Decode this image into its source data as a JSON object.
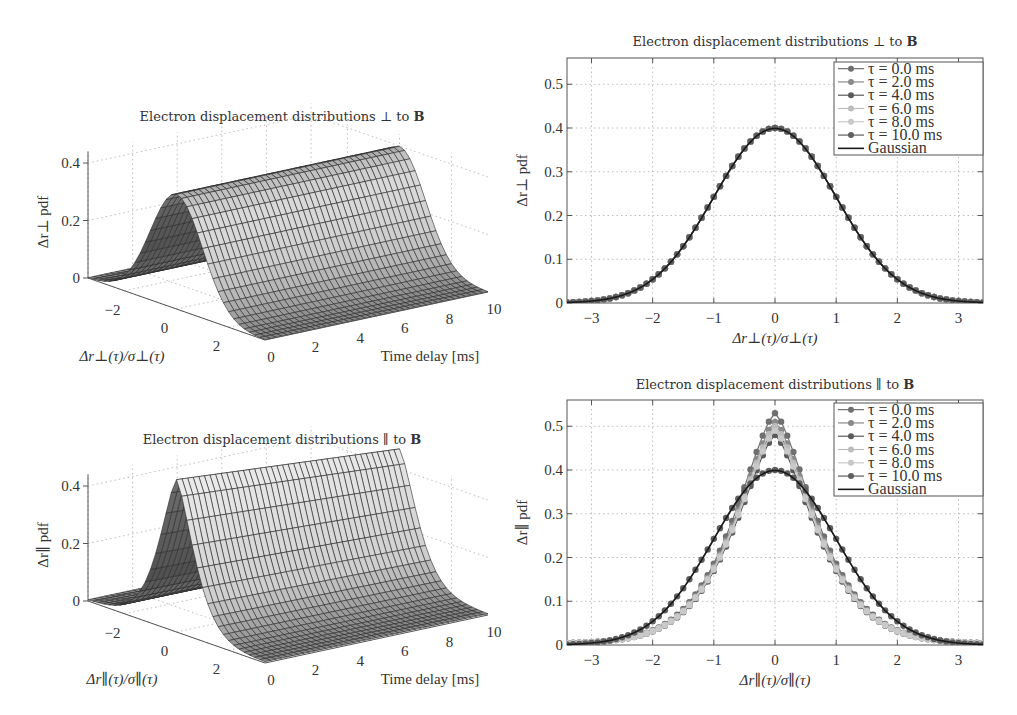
{
  "chart_data": [
    {
      "id": "surf_perp",
      "type": "surface3d",
      "title": "Electron displacement distributions ⊥ to B",
      "xlabel": "Δr⊥(τ)/σ⊥(τ)",
      "ylabel": "Time delay [ms]",
      "zlabel": "Δr⊥ pdf",
      "x_range": [
        -3.4,
        3.4
      ],
      "y_range": [
        0,
        10
      ],
      "z_range": [
        0,
        0.4
      ],
      "x_ticks": [
        -2,
        0,
        2
      ],
      "y_ticks": [
        0,
        2,
        4,
        6,
        8,
        10
      ],
      "z_ticks": [
        0,
        0.2,
        0.4
      ],
      "surface": "Gaussian in x, constant over time; peak 0.40 at x=0",
      "peak_by_time": {
        "0": 0.4,
        "10": 0.4
      }
    },
    {
      "id": "line_perp",
      "type": "line",
      "title": "Electron displacement distributions ⊥ to B",
      "xlabel": "Δr⊥(τ)/σ⊥(τ)",
      "ylabel": "Δr⊥ pdf",
      "xlim": [
        -3.4,
        3.4
      ],
      "ylim": [
        0,
        0.56
      ],
      "x_ticks": [
        -3,
        -2,
        -1,
        0,
        1,
        2,
        3
      ],
      "y_ticks": [
        0,
        0.1,
        0.2,
        0.3,
        0.4,
        0.5
      ],
      "grid": true,
      "legend_position": "upper right",
      "series": [
        {
          "name": "τ = 0.0 ms",
          "color": "#6f6f6f",
          "peak": 0.4,
          "shape": "gaussian"
        },
        {
          "name": "τ = 2.0 ms",
          "color": "#8a8a8a",
          "peak": 0.4,
          "shape": "gaussian"
        },
        {
          "name": "τ = 4.0 ms",
          "color": "#5a5a5a",
          "peak": 0.4,
          "shape": "gaussian"
        },
        {
          "name": "τ = 6.0 ms",
          "color": "#bcbcbc",
          "peak": 0.4,
          "shape": "gaussian"
        },
        {
          "name": "τ = 8.0 ms",
          "color": "#c9c9c9",
          "peak": 0.4,
          "shape": "gaussian"
        },
        {
          "name": "τ = 10.0 ms",
          "color": "#5e5e5e",
          "peak": 0.4,
          "shape": "gaussian"
        },
        {
          "name": "Gaussian",
          "color": "#1a1a1a",
          "peak": 0.399,
          "shape": "line"
        }
      ],
      "x_samples": [
        -3.4,
        -3.2,
        -3.0,
        -2.8,
        -2.6,
        -2.4,
        -2.2,
        -2.0,
        -1.8,
        -1.6,
        -1.4,
        -1.2,
        -1.0,
        -0.8,
        -0.6,
        -0.4,
        -0.2,
        0.0,
        0.2,
        0.4,
        0.6,
        0.8,
        1.0,
        1.2,
        1.4,
        1.6,
        1.8,
        2.0,
        2.2,
        2.4,
        2.6,
        2.8,
        3.0,
        3.2,
        3.4
      ],
      "values_gaussian": [
        0.001,
        0.002,
        0.004,
        0.008,
        0.014,
        0.022,
        0.035,
        0.054,
        0.079,
        0.111,
        0.15,
        0.194,
        0.242,
        0.29,
        0.333,
        0.368,
        0.391,
        0.399,
        0.391,
        0.368,
        0.333,
        0.29,
        0.242,
        0.194,
        0.15,
        0.111,
        0.079,
        0.054,
        0.035,
        0.022,
        0.014,
        0.008,
        0.004,
        0.002,
        0.001
      ]
    },
    {
      "id": "surf_par",
      "type": "surface3d",
      "title": "Electron displacement distributions ∥ to B",
      "xlabel": "Δr∥(τ)/σ∥(τ)",
      "ylabel": "Time delay [ms]",
      "zlabel": "Δr∥ pdf",
      "x_range": [
        -3.4,
        3.4
      ],
      "y_range": [
        0,
        10
      ],
      "z_range": [
        0,
        0.4
      ],
      "x_ticks": [
        -2,
        0,
        2
      ],
      "y_ticks": [
        0,
        2,
        4,
        6,
        8,
        10
      ],
      "z_ticks": [
        0,
        0.2,
        0.4
      ],
      "surface": "Peaked (non-Gaussian) in x; peak decreases from ~0.53 at 0 ms toward ~0.47 at 10 ms",
      "peak_by_time": {
        "0": 0.53,
        "10": 0.47
      }
    },
    {
      "id": "line_par",
      "type": "line",
      "title": "Electron displacement distributions ∥ to B",
      "xlabel": "Δr∥(τ)/σ∥(τ)",
      "ylabel": "Δr∥ pdf",
      "xlim": [
        -3.4,
        3.4
      ],
      "ylim": [
        0,
        0.56
      ],
      "x_ticks": [
        -3,
        -2,
        -1,
        0,
        1,
        2,
        3
      ],
      "y_ticks": [
        0,
        0.1,
        0.2,
        0.3,
        0.4,
        0.5
      ],
      "grid": true,
      "legend_position": "upper right",
      "series": [
        {
          "name": "τ = 0.0 ms",
          "color": "#6f6f6f",
          "peak": 0.53,
          "shape": "peaked"
        },
        {
          "name": "τ = 2.0 ms",
          "color": "#8a8a8a",
          "peak": 0.51,
          "shape": "peaked"
        },
        {
          "name": "τ = 4.0 ms",
          "color": "#5a5a5a",
          "peak": 0.48,
          "shape": "peaked"
        },
        {
          "name": "τ = 6.0 ms",
          "color": "#bcbcbc",
          "peak": 0.5,
          "shape": "peaked"
        },
        {
          "name": "τ = 8.0 ms",
          "color": "#c9c9c9",
          "peak": 0.49,
          "shape": "peaked"
        },
        {
          "name": "τ = 10.0 ms",
          "color": "#5e5e5e",
          "peak": 0.4,
          "shape": "gaussian"
        },
        {
          "name": "Gaussian",
          "color": "#1a1a1a",
          "peak": 0.399,
          "shape": "line"
        }
      ],
      "x_samples": [
        -3.4,
        -3.2,
        -3.0,
        -2.8,
        -2.6,
        -2.4,
        -2.2,
        -2.0,
        -1.8,
        -1.6,
        -1.4,
        -1.2,
        -1.0,
        -0.8,
        -0.6,
        -0.4,
        -0.2,
        0.0,
        0.2,
        0.4,
        0.6,
        0.8,
        1.0,
        1.2,
        1.4,
        1.6,
        1.8,
        2.0,
        2.2,
        2.4,
        2.6,
        2.8,
        3.0,
        3.2,
        3.4
      ],
      "values_tau0": [
        0.004,
        0.005,
        0.007,
        0.009,
        0.012,
        0.017,
        0.024,
        0.034,
        0.049,
        0.07,
        0.098,
        0.135,
        0.182,
        0.238,
        0.31,
        0.4,
        0.48,
        0.53,
        0.48,
        0.4,
        0.31,
        0.238,
        0.182,
        0.135,
        0.098,
        0.07,
        0.049,
        0.034,
        0.024,
        0.017,
        0.012,
        0.009,
        0.007,
        0.005,
        0.004
      ]
    }
  ],
  "labels": {
    "tl_title": "Electron displacement distributions ⊥ to ",
    "tr_title": "Electron displacement distributions ⊥ to ",
    "bl_title": "Electron displacement distributions ∥ to ",
    "br_title": "Electron displacement distributions ∥ to ",
    "bold_B": "B",
    "time_delay": "Time delay [ms]"
  }
}
